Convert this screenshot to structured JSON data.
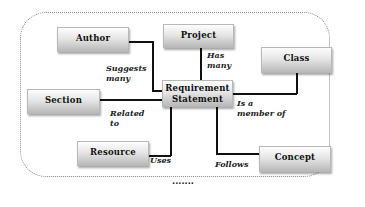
{
  "diagram": {
    "center": {
      "line1": "Requirement",
      "line2": "Statement"
    },
    "entities": {
      "author": "Author",
      "project": "Project",
      "class": "Class",
      "section": "Section",
      "resource": "Resource",
      "concept": "Concept"
    },
    "relations": {
      "author": "Suggests\nmany",
      "project": "Has\nmany",
      "class": "Is a\nmember of",
      "section": "Related\nto",
      "resource": "Uses",
      "concept": "Follows"
    },
    "ellipsis": "......."
  }
}
